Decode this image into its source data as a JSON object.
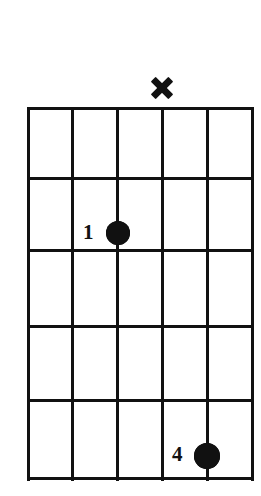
{
  "diagram": {
    "type": "guitar-chord-diagram",
    "background_color": "#ffffff",
    "ink_color": "#111111",
    "string_count": 6,
    "fret_count": 5,
    "grid": {
      "left": 28,
      "right": 252,
      "top": 108,
      "bottom": 478,
      "string_x": [
        28,
        72,
        117,
        162,
        207,
        252
      ],
      "fret_y": [
        108,
        178,
        250,
        326,
        400,
        478
      ],
      "line_thickness": 3
    },
    "string_markers": [
      {
        "name": "mute-marker-string-4",
        "symbol": "x",
        "string_index": 3,
        "x": 162,
        "y": 88,
        "size": 26,
        "meaning": "muted"
      }
    ],
    "finger_positions": [
      {
        "name": "finger-dot-1",
        "finger": "1",
        "string_index": 2,
        "fret": 2,
        "x": 118,
        "y": 233,
        "radius": 12,
        "label_x": 83,
        "label_y": 222
      },
      {
        "name": "finger-dot-4",
        "finger": "4",
        "string_index": 4,
        "fret": 5,
        "x": 207,
        "y": 456,
        "radius": 13,
        "label_x": 172,
        "label_y": 444
      }
    ]
  }
}
